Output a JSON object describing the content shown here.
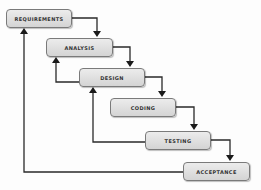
{
  "diagram": {
    "type": "waterfall-model",
    "stages": [
      {
        "id": "requirements",
        "label": "REQUIREMENTS"
      },
      {
        "id": "analysis",
        "label": "ANALYSIS"
      },
      {
        "id": "design",
        "label": "DESIGN"
      },
      {
        "id": "coding",
        "label": "CODING"
      },
      {
        "id": "testing",
        "label": "TESTING"
      },
      {
        "id": "acceptance",
        "label": "ACCEPTANCE"
      }
    ],
    "flow_arrows": [
      {
        "from": "requirements",
        "to": "analysis"
      },
      {
        "from": "analysis",
        "to": "design"
      },
      {
        "from": "design",
        "to": "coding"
      },
      {
        "from": "coding",
        "to": "testing"
      },
      {
        "from": "testing",
        "to": "acceptance"
      }
    ],
    "feedback_arrows": [
      {
        "from": "design",
        "to": "analysis"
      },
      {
        "from": "testing",
        "to": "design"
      },
      {
        "from": "acceptance",
        "to": "requirements"
      }
    ],
    "colors": {
      "box_fill": "#dcdcdc",
      "box_border": "#7a7a7a",
      "line": "#222222"
    }
  }
}
